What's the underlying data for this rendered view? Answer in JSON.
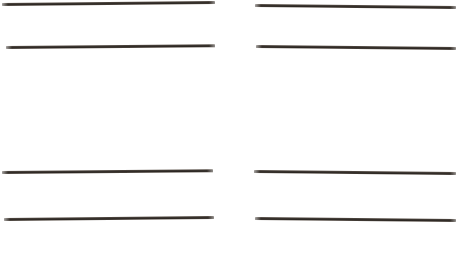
{
  "page": {
    "width": 463,
    "height": 271,
    "background_color": "#ffffff",
    "document_type": "scanned-page-with-ruled-lines",
    "column_count": 2,
    "rows_per_column": 4,
    "total_rules": 8
  },
  "ink": {
    "color": "#3a342f",
    "color_light": "#5a5149",
    "color_dark": "#2b2622"
  },
  "columns": [
    {
      "name": "left-column",
      "rules": [
        {
          "id": "left-rule-1",
          "x": 2,
          "y": 3,
          "length": 213,
          "thickness": 3.0,
          "angle_deg": -0.55,
          "color": "#3a342f"
        },
        {
          "id": "left-rule-2",
          "x": 6,
          "y": 46,
          "length": 209,
          "thickness": 3.0,
          "angle_deg": -0.5,
          "color": "#3a342f"
        },
        {
          "id": "left-rule-3",
          "x": 2,
          "y": 171,
          "length": 211,
          "thickness": 3.2,
          "angle_deg": -0.5,
          "color": "#3a342f"
        },
        {
          "id": "left-rule-4",
          "x": 4,
          "y": 218,
          "length": 210,
          "thickness": 3.2,
          "angle_deg": -0.55,
          "color": "#3a342f"
        }
      ]
    },
    {
      "name": "right-column",
      "rules": [
        {
          "id": "right-rule-1",
          "x": 255,
          "y": 4,
          "length": 201,
          "thickness": 3.0,
          "angle_deg": 0.6,
          "color": "#3a342f"
        },
        {
          "id": "right-rule-2",
          "x": 256,
          "y": 45,
          "length": 200,
          "thickness": 3.0,
          "angle_deg": 0.55,
          "color": "#3a342f"
        },
        {
          "id": "right-rule-3",
          "x": 254,
          "y": 170,
          "length": 202,
          "thickness": 3.2,
          "angle_deg": 0.6,
          "color": "#3a342f"
        },
        {
          "id": "right-rule-4",
          "x": 255,
          "y": 217,
          "length": 201,
          "thickness": 3.2,
          "angle_deg": 0.55,
          "color": "#3a342f"
        }
      ]
    }
  ]
}
